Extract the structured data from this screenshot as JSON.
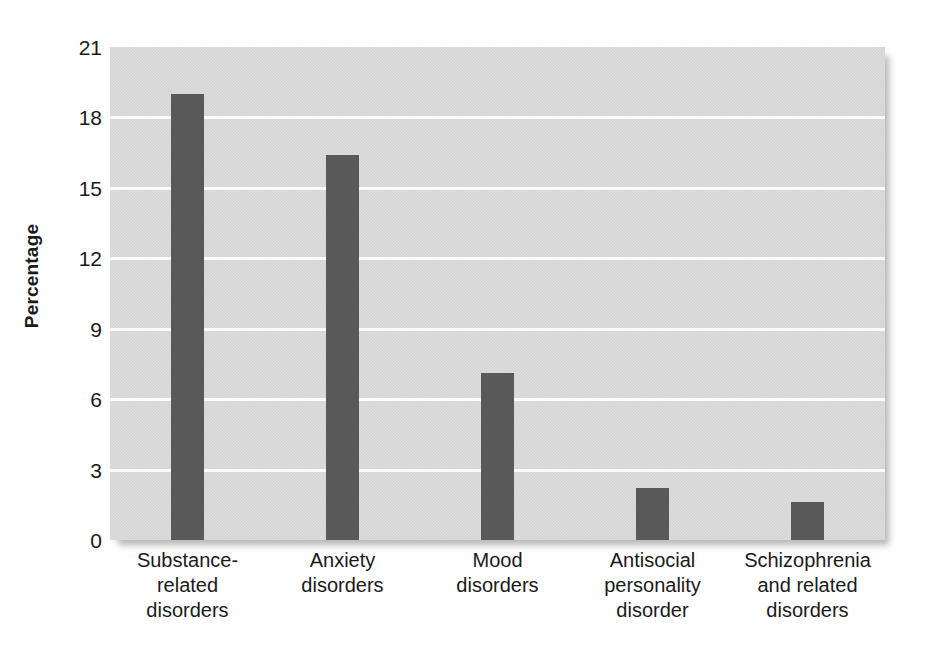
{
  "chart_data": {
    "type": "bar",
    "title": "",
    "subtitle": "",
    "xlabel": "",
    "ylabel": "Percentage",
    "categories": [
      "Substance-\nrelated\ndisorders",
      "Anxiety\ndisorders",
      "Mood\ndisorders",
      "Antisocial\npersonality\ndisorder",
      "Schizophrenia\nand related\ndisorders"
    ],
    "values": [
      19.0,
      16.4,
      7.1,
      2.2,
      1.6
    ],
    "ylim": [
      0,
      21
    ],
    "yticks": [
      0,
      3,
      6,
      9,
      12,
      15,
      18,
      21
    ],
    "ytick_labels": [
      "0",
      "3",
      "6",
      "9",
      "12",
      "15",
      "18",
      "21"
    ],
    "grid": true,
    "grid_axis": "y",
    "legend": "none",
    "colors": {
      "bar": "#595959",
      "plot_background": "#d6d6d6",
      "gridline": "#fbfbfb",
      "figure_background": "#ffffff",
      "text": "#1a1a1a"
    }
  },
  "axis": {
    "y_title": "Percentage"
  }
}
